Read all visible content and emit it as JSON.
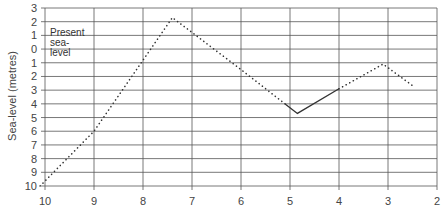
{
  "chart_data": {
    "type": "line",
    "title": "",
    "xlabel": "",
    "ylabel": "Sea-level (metres)",
    "x_ticks": [
      "10",
      "9",
      "8",
      "7",
      "6",
      "5",
      "4",
      "3",
      "2"
    ],
    "y_ticks": [
      "3",
      "2",
      "1",
      "0",
      "1",
      "2",
      "3",
      "4",
      "5",
      "6",
      "7",
      "8",
      "9",
      "10"
    ],
    "xlim": [
      10,
      2
    ],
    "ylim": [
      -10,
      3
    ],
    "x_reversed": true,
    "grid": true,
    "annotation": [
      "Present",
      "sea-",
      "level"
    ],
    "annotation_at_y": 0,
    "series": [
      {
        "name": "Sea-level curve",
        "x": [
          10.1,
          9.0,
          7.4,
          6.0,
          4.85,
          4.0,
          3.1,
          2.45
        ],
        "y": [
          -10.0,
          -6.0,
          2.3,
          -1.5,
          -4.7,
          -2.9,
          -1.1,
          -2.8
        ],
        "segments": [
          {
            "style": "dotted",
            "from_x": 10.1,
            "to_x": 5.1
          },
          {
            "style": "solid",
            "from_x": 5.1,
            "to_x": 4.0
          },
          {
            "style": "dotted",
            "from_x": 4.0,
            "to_x": 2.45
          }
        ]
      }
    ],
    "legend": null,
    "colors": {
      "line": "#333333",
      "grid": "#555555",
      "text": "#444444"
    }
  }
}
